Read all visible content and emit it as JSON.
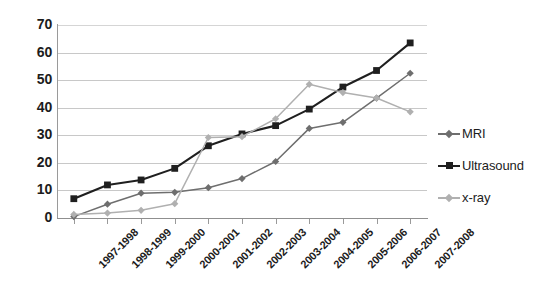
{
  "chart_data": {
    "type": "line",
    "title": "",
    "subtitle": "",
    "xlabel": "",
    "ylabel": "",
    "ylim": [
      0,
      70
    ],
    "ytick_step": 10,
    "yticks": [
      70,
      60,
      50,
      40,
      30,
      20,
      10,
      0
    ],
    "grid": true,
    "grid_axis": "y",
    "legend_position": "right",
    "categories": [
      "1997-1998",
      "1998-1999",
      "1999-2000",
      "2000-2001",
      "2001-2002",
      "2002-2003",
      "2003-2004",
      "2004-2005",
      "2005-2006",
      "2006-2007",
      "2007-2008"
    ],
    "series": [
      {
        "name": "MRI",
        "color": "#6e6e6e",
        "marker": "diamond",
        "values": [
          0.5,
          5,
          9,
          9.3,
          11,
          14.3,
          20.5,
          32.5,
          34.7,
          43.5,
          52.5
        ]
      },
      {
        "name": "Ultrasound",
        "color": "#1f1f1f",
        "marker": "square",
        "values": [
          7,
          12,
          13.8,
          18,
          26.2,
          30.5,
          33.5,
          39.5,
          47.5,
          53.5,
          63.5
        ]
      },
      {
        "name": "x-ray",
        "color": "#b0b0b0",
        "marker": "diamond",
        "values": [
          1.3,
          1.8,
          2.8,
          5.2,
          29.2,
          29.5,
          36,
          48.5,
          45.5,
          43.5,
          38.5
        ]
      }
    ]
  },
  "legend": {
    "entries": [
      {
        "label": "MRI"
      },
      {
        "label": "Ultrasound"
      },
      {
        "label": "x-ray"
      }
    ]
  },
  "colors": {
    "background": "#ffffff",
    "gridline": "#c8c8c8",
    "axis": "#8f8f8f",
    "text": "#1c1c1c",
    "mri": "#6e6e6e",
    "ultrasound": "#1f1f1f",
    "xray": "#b0b0b0"
  }
}
